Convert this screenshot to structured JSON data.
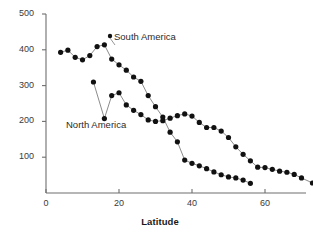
{
  "chart_data": {
    "type": "scatter",
    "title": "",
    "xlabel": "Latitude",
    "ylabel": "No. species",
    "xlim": [
      0,
      78
    ],
    "ylim": [
      0,
      500
    ],
    "xticks": [
      0,
      20,
      40,
      60
    ],
    "yticks": [
      100,
      200,
      300,
      400,
      500
    ],
    "grid": false,
    "legend_position": "inline-annotations",
    "marker": "filled-circle",
    "marker_color": "#111111",
    "line_color": "#8c8c8c",
    "axis_color": "#6e6e6e",
    "series": [
      {
        "name": "South America",
        "label_x": 22,
        "label_y": 420,
        "points": [
          [
            4,
            393
          ],
          [
            6,
            399
          ],
          [
            8,
            379
          ],
          [
            10,
            372
          ],
          [
            12,
            384
          ],
          [
            14,
            409
          ],
          [
            16,
            414
          ],
          [
            18,
            374
          ],
          [
            20,
            358
          ],
          [
            22,
            343
          ],
          [
            24,
            324
          ],
          [
            26,
            312
          ],
          [
            28,
            272
          ],
          [
            30,
            241
          ],
          [
            32,
            212
          ],
          [
            34,
            170
          ],
          [
            36,
            143
          ],
          [
            38,
            92
          ],
          [
            40,
            83
          ],
          [
            42,
            76
          ],
          [
            44,
            68
          ],
          [
            46,
            59
          ],
          [
            48,
            51
          ],
          [
            50,
            45
          ],
          [
            52,
            42
          ],
          [
            54,
            36
          ],
          [
            56,
            27
          ]
        ]
      },
      {
        "name": "North America",
        "label_x": 9,
        "label_y": 158,
        "points": [
          [
            13,
            310
          ],
          [
            16,
            208
          ],
          [
            18,
            272
          ],
          [
            20,
            280
          ],
          [
            22,
            246
          ],
          [
            24,
            231
          ],
          [
            26,
            219
          ],
          [
            28,
            204
          ],
          [
            30,
            200
          ],
          [
            32,
            202
          ],
          [
            34,
            209
          ],
          [
            36,
            216
          ],
          [
            38,
            221
          ],
          [
            40,
            215
          ],
          [
            42,
            197
          ],
          [
            44,
            183
          ],
          [
            46,
            183
          ],
          [
            48,
            173
          ],
          [
            50,
            155
          ],
          [
            52,
            129
          ],
          [
            54,
            108
          ],
          [
            56,
            90
          ],
          [
            58,
            72
          ],
          [
            60,
            71
          ],
          [
            62,
            66
          ],
          [
            64,
            61
          ],
          [
            66,
            58
          ],
          [
            68,
            52
          ],
          [
            70,
            42
          ],
          [
            73,
            28
          ]
        ]
      }
    ]
  },
  "axes": {
    "y_title": "No. species",
    "x_title": "Latitude",
    "y_tick_labels": [
      "500",
      "400",
      "300",
      "200",
      "100"
    ],
    "x_tick_labels": [
      "0",
      "20",
      "40",
      "60"
    ]
  },
  "annotations": {
    "south_america": "South America",
    "north_america": "North America"
  }
}
